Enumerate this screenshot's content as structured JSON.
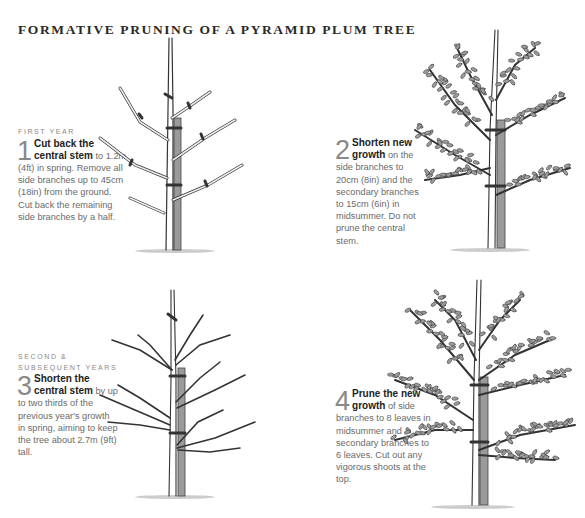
{
  "title": "FORMATIVE PRUNING OF A PYRAMID PLUM TREE",
  "steps": [
    {
      "kicker": "FIRST YEAR",
      "number": "1",
      "lead": "Cut back the central stem",
      "body": " to 1.2m (4ft) in spring. Remove all side branches up to 45cm (18in) from the ground. Cut back the remaining side branches by a half."
    },
    {
      "kicker": "",
      "number": "2",
      "lead": "Shorten new growth",
      "body": " on the side branches to 20cm (8in) and the secondary branches to 15cm (6in) in midsummer. Do not prune the central stem."
    },
    {
      "kicker": "SECOND & SUBSEQUENT YEARS",
      "number": "3",
      "lead": "Shorten the central stem",
      "body": " by up to two thirds of the previous year's growth in spring, aiming to keep the tree about 2.7m (9ft) tall."
    },
    {
      "kicker": "",
      "number": "4",
      "lead": "Prune the new growth",
      "body": " of side branches to 8 leaves in midsummer and secondary branches to 6 leaves. Cut out any vigorous shoots at the top."
    }
  ],
  "illustrations": [
    {
      "name": "tree-year1-pruned",
      "icon": "bare-tree-with-cut-marks"
    },
    {
      "name": "tree-year1-summer",
      "icon": "leafy-tree"
    },
    {
      "name": "tree-year2-pruned",
      "icon": "bare-tree-with-cut-marks"
    },
    {
      "name": "tree-year2-summer",
      "icon": "leafy-tree"
    }
  ],
  "colors": {
    "ink": "#333333",
    "bark": "#e9e9e9",
    "stake": "#8a8a8a",
    "leaf": "#9c9c9c"
  }
}
